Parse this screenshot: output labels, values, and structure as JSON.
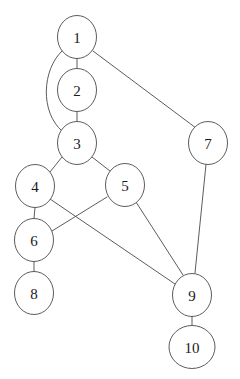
{
  "diagram": {
    "type": "node-link-graph",
    "directed": false,
    "background_color": "#ffffff",
    "stroke_color": "#4a4a4a",
    "label_color": "#1a1a1a",
    "node_fill": "#ffffff",
    "canvas": {
      "width": 240,
      "height": 379
    }
  },
  "nodes": [
    {
      "id": "1",
      "label": "1",
      "cx": 77,
      "cy": 37,
      "rx": 19.5,
      "ry": 21.5
    },
    {
      "id": "2",
      "label": "2",
      "cx": 77,
      "cy": 90,
      "rx": 19.5,
      "ry": 21.5
    },
    {
      "id": "3",
      "label": "3",
      "cx": 77,
      "cy": 143,
      "rx": 19.5,
      "ry": 21.5
    },
    {
      "id": "4",
      "label": "4",
      "cx": 35,
      "cy": 186,
      "rx": 19.5,
      "ry": 21.5
    },
    {
      "id": "5",
      "label": "5",
      "cx": 125,
      "cy": 185,
      "rx": 19.5,
      "ry": 21.5
    },
    {
      "id": "6",
      "label": "6",
      "cx": 34,
      "cy": 240,
      "rx": 19.5,
      "ry": 21.5
    },
    {
      "id": "7",
      "label": "7",
      "cx": 208,
      "cy": 143,
      "rx": 19.5,
      "ry": 21.5
    },
    {
      "id": "8",
      "label": "8",
      "cx": 34,
      "cy": 293,
      "rx": 19.5,
      "ry": 21.5
    },
    {
      "id": "9",
      "label": "9",
      "cx": 192,
      "cy": 295,
      "rx": 19.5,
      "ry": 21.5
    },
    {
      "id": "10",
      "label": "10",
      "cx": 192,
      "cy": 347,
      "rx": 23.0,
      "ry": 21.5
    }
  ],
  "edges": [
    {
      "id": "e1",
      "source": "1",
      "target": "2",
      "shape": "line",
      "path": "M 77,58.5 L 77,68.5"
    },
    {
      "id": "e2",
      "source": "1",
      "target": "3",
      "shape": "curve",
      "path": "M 62,51 C 42,70 40,112 62,131"
    },
    {
      "id": "e3",
      "source": "1",
      "target": "7",
      "shape": "line",
      "path": "M 93,51 L 196,128"
    },
    {
      "id": "e4",
      "source": "2",
      "target": "3",
      "shape": "line",
      "path": "M 77,111.5 L 77,121.5"
    },
    {
      "id": "e5",
      "source": "3",
      "target": "4",
      "shape": "line",
      "path": "M 62,157 L 50,172"
    },
    {
      "id": "e6",
      "source": "3",
      "target": "5",
      "shape": "line",
      "path": "M 92,157 L 110,171"
    },
    {
      "id": "e7",
      "source": "4",
      "target": "6",
      "shape": "line",
      "path": "M 35,207.5 L 34,218.5"
    },
    {
      "id": "e8",
      "source": "4",
      "target": "9",
      "shape": "line",
      "path": "M 50,199 L 175,284"
    },
    {
      "id": "e9",
      "source": "5",
      "target": "6",
      "shape": "line",
      "path": "M 107,197 L 52,231"
    },
    {
      "id": "e10",
      "source": "5",
      "target": "9",
      "shape": "line",
      "path": "M 136,202 L 183,275"
    },
    {
      "id": "e11",
      "source": "6",
      "target": "8",
      "shape": "line",
      "path": "M 34,261.5 L 34,271.5"
    },
    {
      "id": "e12",
      "source": "7",
      "target": "9",
      "shape": "line",
      "path": "M 206,164.5 L 195,273"
    },
    {
      "id": "e13",
      "source": "9",
      "target": "10",
      "shape": "line",
      "path": "M 192,316.5 L 192,325.5"
    }
  ]
}
